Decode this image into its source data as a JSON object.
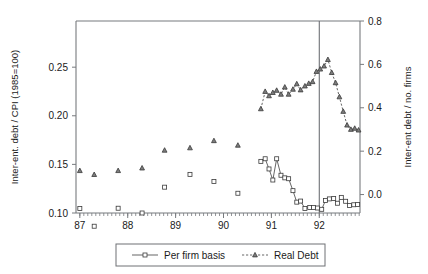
{
  "chart_data": {
    "type": "scatter",
    "title": "",
    "xlabel": "",
    "ylabel": "Inter-ent. debt / CPI (1985=100)",
    "y2label": "Inter-ent debt / no. firms",
    "xlim": [
      86.92,
      92.85
    ],
    "ylim": [
      0.1,
      0.2975
    ],
    "y2lim": [
      -0.085,
      0.8
    ],
    "grid": false,
    "legend_position": "bottom",
    "x_ticklabels": [
      "87",
      "88",
      "89",
      "90",
      "91",
      "92"
    ],
    "x_tickvalues": [
      87,
      88,
      89,
      90,
      91,
      92
    ],
    "x_minor_interval": 0.0833,
    "y_ticklabels": [
      "0.10",
      "0.15",
      "0.20",
      "0.25"
    ],
    "y_tickvalues": [
      0.1,
      0.15,
      0.2,
      0.25
    ],
    "y2_ticklabels": [
      "0.0",
      "0.2",
      "0.4",
      "0.6",
      "0.8"
    ],
    "y2_tickvalues": [
      0.0,
      0.2,
      0.4,
      0.6,
      0.8
    ],
    "annotations": [
      {
        "type": "vline",
        "x": 92.0,
        "label": ""
      }
    ],
    "series": [
      {
        "name": "Per firm basis",
        "axis": "right",
        "marker": "square",
        "linestyle": "solid",
        "color": "#4a4a4a",
        "points": [
          {
            "x": 87.0,
            "y": -0.064,
            "connected": false
          },
          {
            "x": 87.3,
            "y": -0.146,
            "connected": false
          },
          {
            "x": 87.8,
            "y": -0.063,
            "connected": false
          },
          {
            "x": 88.3,
            "y": -0.085,
            "connected": false
          },
          {
            "x": 88.77,
            "y": 0.034,
            "connected": false
          },
          {
            "x": 89.3,
            "y": 0.093,
            "connected": false
          },
          {
            "x": 89.8,
            "y": 0.06,
            "connected": false
          },
          {
            "x": 90.3,
            "y": 0.006,
            "connected": false
          },
          {
            "x": 90.78,
            "y": 0.153,
            "connected": true
          },
          {
            "x": 90.87,
            "y": 0.165,
            "connected": true
          },
          {
            "x": 90.95,
            "y": 0.118,
            "connected": true
          },
          {
            "x": 91.03,
            "y": 0.067,
            "connected": true
          },
          {
            "x": 91.11,
            "y": 0.165,
            "connected": true
          },
          {
            "x": 91.2,
            "y": 0.089,
            "connected": true
          },
          {
            "x": 91.28,
            "y": 0.077,
            "connected": true
          },
          {
            "x": 91.36,
            "y": 0.073,
            "connected": true
          },
          {
            "x": 91.45,
            "y": 0.018,
            "connected": true
          },
          {
            "x": 91.53,
            "y": -0.035,
            "connected": true
          },
          {
            "x": 91.61,
            "y": -0.03,
            "connected": true
          },
          {
            "x": 91.7,
            "y": -0.064,
            "connected": true
          },
          {
            "x": 91.8,
            "y": -0.06,
            "connected": true
          },
          {
            "x": 91.88,
            "y": -0.06,
            "connected": true
          },
          {
            "x": 91.96,
            "y": -0.062,
            "connected": true
          },
          {
            "x": 92.05,
            "y": -0.068,
            "connected": true
          },
          {
            "x": 92.13,
            "y": -0.027,
            "connected": true
          },
          {
            "x": 92.21,
            "y": -0.02,
            "connected": true
          },
          {
            "x": 92.3,
            "y": -0.018,
            "connected": true
          },
          {
            "x": 92.38,
            "y": -0.04,
            "connected": true
          },
          {
            "x": 92.46,
            "y": -0.013,
            "connected": true
          },
          {
            "x": 92.55,
            "y": -0.031,
            "connected": true
          },
          {
            "x": 92.63,
            "y": -0.05,
            "connected": true
          },
          {
            "x": 92.72,
            "y": -0.047,
            "connected": true
          },
          {
            "x": 92.8,
            "y": -0.046,
            "connected": true
          }
        ]
      },
      {
        "name": "Real Debt",
        "axis": "right",
        "marker": "triangle",
        "linestyle": "dashed",
        "color": "#4a4a4a",
        "points": [
          {
            "x": 87.0,
            "y": 0.11,
            "connected": false
          },
          {
            "x": 87.3,
            "y": 0.092,
            "connected": false
          },
          {
            "x": 87.8,
            "y": 0.11,
            "connected": false
          },
          {
            "x": 88.3,
            "y": 0.122,
            "connected": false
          },
          {
            "x": 88.77,
            "y": 0.204,
            "connected": false
          },
          {
            "x": 89.3,
            "y": 0.215,
            "connected": false
          },
          {
            "x": 89.8,
            "y": 0.248,
            "connected": false
          },
          {
            "x": 90.3,
            "y": 0.227,
            "connected": false
          },
          {
            "x": 90.78,
            "y": 0.395,
            "connected": true
          },
          {
            "x": 90.87,
            "y": 0.475,
            "connected": true
          },
          {
            "x": 90.95,
            "y": 0.455,
            "connected": true
          },
          {
            "x": 91.03,
            "y": 0.47,
            "connected": true
          },
          {
            "x": 91.11,
            "y": 0.48,
            "connected": true
          },
          {
            "x": 91.2,
            "y": 0.462,
            "connected": true
          },
          {
            "x": 91.28,
            "y": 0.495,
            "connected": true
          },
          {
            "x": 91.36,
            "y": 0.462,
            "connected": true
          },
          {
            "x": 91.45,
            "y": 0.485,
            "connected": true
          },
          {
            "x": 91.53,
            "y": 0.51,
            "connected": true
          },
          {
            "x": 91.61,
            "y": 0.482,
            "connected": true
          },
          {
            "x": 91.7,
            "y": 0.5,
            "connected": true
          },
          {
            "x": 91.78,
            "y": 0.512,
            "connected": true
          },
          {
            "x": 91.86,
            "y": 0.52,
            "connected": true
          },
          {
            "x": 91.94,
            "y": 0.567,
            "connected": true
          },
          {
            "x": 92.02,
            "y": 0.578,
            "connected": true
          },
          {
            "x": 92.1,
            "y": 0.592,
            "connected": true
          },
          {
            "x": 92.18,
            "y": 0.622,
            "connected": true
          },
          {
            "x": 92.26,
            "y": 0.562,
            "connected": true
          },
          {
            "x": 92.34,
            "y": 0.515,
            "connected": true
          },
          {
            "x": 92.42,
            "y": 0.45,
            "connected": true
          },
          {
            "x": 92.5,
            "y": 0.383,
            "connected": true
          },
          {
            "x": 92.58,
            "y": 0.32,
            "connected": true
          },
          {
            "x": 92.66,
            "y": 0.3,
            "connected": true
          },
          {
            "x": 92.74,
            "y": 0.305,
            "connected": true
          },
          {
            "x": 92.82,
            "y": 0.297,
            "connected": true
          }
        ]
      }
    ],
    "legend_entries": [
      {
        "label": "Per firm basis",
        "marker": "square",
        "linestyle": "solid"
      },
      {
        "label": "Real Debt",
        "marker": "triangle",
        "linestyle": "dashed"
      }
    ]
  }
}
